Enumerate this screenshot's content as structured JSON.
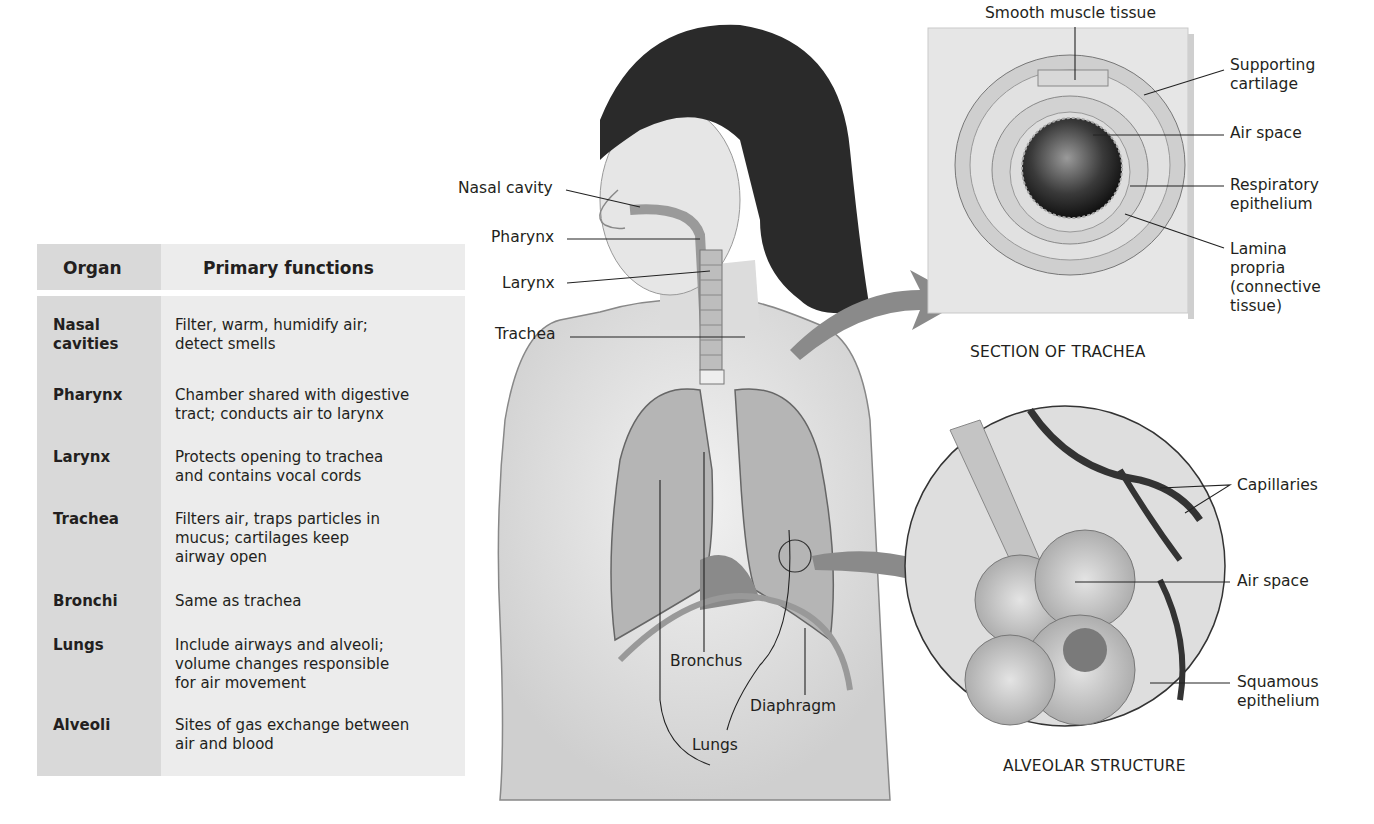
{
  "table": {
    "headers": {
      "organ": "Organ",
      "functions": "Primary functions"
    },
    "rows": [
      {
        "organ": "Nasal\ncavities",
        "functions": "Filter, warm, humidify air;\n detect smells"
      },
      {
        "organ": "Pharynx",
        "functions": "Chamber shared with digestive\n tract; conducts air to larynx"
      },
      {
        "organ": "Larynx",
        "functions": "Protects opening to trachea\n and contains vocal cords"
      },
      {
        "organ": "Trachea",
        "functions": "Filters air, traps particles in\n mucus; cartilages keep\n airway open"
      },
      {
        "organ": "Bronchi",
        "functions": "Same as trachea"
      },
      {
        "organ": "Lungs",
        "functions": "Include airways and alveoli;\n volume changes responsible\n for air movement"
      },
      {
        "organ": "Alveoli",
        "functions": "Sites of gas exchange between\n air and blood"
      }
    ]
  },
  "body_labels": {
    "nasal_cavity": "Nasal cavity",
    "pharynx": "Pharynx",
    "larynx": "Larynx",
    "trachea": "Trachea",
    "bronchus": "Bronchus",
    "lungs": "Lungs",
    "diaphragm": "Diaphragm"
  },
  "trachea_section": {
    "caption": "SECTION OF TRACHEA",
    "labels": {
      "smooth_muscle": "Smooth muscle tissue",
      "cartilage": "Supporting\ncartilage",
      "air_space": "Air space",
      "epithelium": "Respiratory\nepithelium",
      "lamina": "Lamina\npropria\n(connective\ntissue)"
    }
  },
  "alveolar_structure": {
    "caption": "ALVEOLAR STRUCTURE",
    "labels": {
      "capillaries": "Capillaries",
      "air_space": "Air space",
      "squamous": "Squamous\nepithelium"
    }
  },
  "colors": {
    "arrow": "#8a8a8a",
    "table_dark": "#d9d9d9",
    "table_light": "#ececec",
    "text": "#231f20"
  }
}
